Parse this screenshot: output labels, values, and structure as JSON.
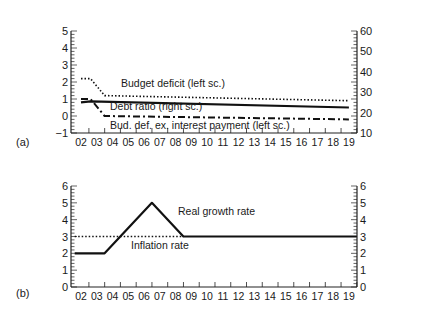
{
  "chart_data": [
    {
      "panel": "(a)",
      "type": "line",
      "xlabel": "",
      "x_ticks": [
        "02",
        "03",
        "04",
        "05",
        "06",
        "07",
        "08",
        "09",
        "10",
        "11",
        "12",
        "13",
        "14",
        "15",
        "16",
        "17",
        "18",
        "19"
      ],
      "left_ylim": [
        -1,
        5
      ],
      "left_yticks": [
        "5",
        "4",
        "3",
        "2",
        "1",
        "0",
        "-1"
      ],
      "right_ylim": [
        10,
        60
      ],
      "right_yticks": [
        "60",
        "50",
        "40",
        "30",
        "20",
        "10"
      ],
      "series": [
        {
          "name": "Budget deficit (left sc.)",
          "axis": "left",
          "style": "dotted",
          "x": [
            2.0,
            2.6,
            3.5,
            19.0
          ],
          "values": [
            2.2,
            2.2,
            1.2,
            0.9
          ]
        },
        {
          "name": "Debt ratio (right sc.)",
          "axis": "right",
          "style": "solid",
          "x": [
            2.0,
            2.6,
            19.0
          ],
          "values": [
            25.0,
            25.5,
            22.5
          ]
        },
        {
          "name": "Bud. def. ex. interest payment (left sc.)",
          "axis": "left",
          "style": "dash-dot",
          "x": [
            2.0,
            2.6,
            3.5,
            19.0
          ],
          "values": [
            1.0,
            1.0,
            0.0,
            -0.2
          ]
        }
      ],
      "annotations": [
        "Budget deficit (left sc.)",
        "Debt ratio (right sc.)",
        "Bud. def. ex. interest payment (left sc.)"
      ]
    },
    {
      "panel": "(b)",
      "type": "line",
      "x_ticks": [
        "02",
        "03",
        "04",
        "05",
        "06",
        "07",
        "08",
        "09",
        "10",
        "11",
        "12",
        "13",
        "14",
        "15",
        "16",
        "17",
        "18",
        "19"
      ],
      "left_ylim": [
        0,
        6
      ],
      "left_yticks": [
        "6",
        "5",
        "4",
        "3",
        "2",
        "1",
        "0"
      ],
      "right_ylim": [
        0,
        6
      ],
      "right_yticks": [
        "6",
        "5",
        "4",
        "3",
        "2",
        "1",
        "0"
      ],
      "series": [
        {
          "name": "Real growth rate",
          "style": "solid",
          "x": [
            1.6,
            3.5,
            6.5,
            8.5,
            19.5
          ],
          "values": [
            2,
            2,
            5,
            3,
            3
          ]
        },
        {
          "name": "Inflation rate",
          "style": "dotted",
          "x": [
            1.6,
            8.5
          ],
          "values": [
            3,
            3
          ]
        }
      ],
      "annotations": [
        "Real growth rate",
        "Inflation rate"
      ]
    }
  ],
  "labels": {
    "panel_a": "(a)",
    "panel_b": "(b)",
    "budget_deficit": "Budget deficit (left sc.)",
    "debt_ratio": "Debt ratio (right sc.)",
    "bud_def_ex": "Bud. def. ex. interest payment (left sc.)",
    "real_growth": "Real growth rate",
    "inflation": "Inflation rate"
  }
}
